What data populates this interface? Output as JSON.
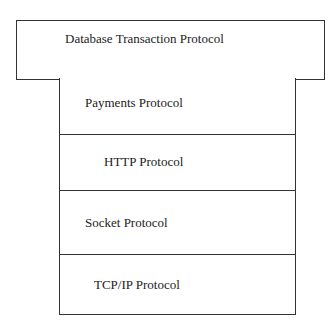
{
  "diagram": {
    "title_layer": {
      "label": "Database Transaction Protocol"
    },
    "layers": [
      {
        "label": "Payments Protocol"
      },
      {
        "label": "HTTP Protocol"
      },
      {
        "label": "Socket Protocol"
      },
      {
        "label": "TCP/IP Protocol"
      }
    ]
  }
}
